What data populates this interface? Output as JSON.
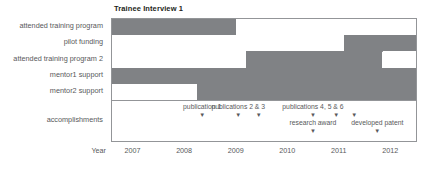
{
  "chart_data": {
    "type": "bar",
    "title": "Trainee Interview 1",
    "xlabel": "Year",
    "ylabel": "",
    "xlim": [
      2006.6,
      2012.5
    ],
    "grid": false,
    "legend": null,
    "tick_labels": [
      "2007",
      "2008",
      "2009",
      "2010",
      "2011",
      "2012"
    ],
    "tick_values": [
      2007,
      2008,
      2009,
      2010,
      2011,
      2012
    ],
    "categories": [
      "attended training program",
      "pilot funding",
      "attended training program 2",
      "mentor1 support",
      "mentor2 support",
      "accomplishments"
    ],
    "series": [
      {
        "name": "attended training program",
        "intervals": [
          {
            "start": 2006.6,
            "end": 2009.0,
            "active": true
          },
          {
            "start": 2009.0,
            "end": 2012.5,
            "active": false
          }
        ]
      },
      {
        "name": "pilot funding",
        "intervals": [
          {
            "start": 2006.6,
            "end": 2011.1,
            "active": false
          },
          {
            "start": 2011.1,
            "end": 2012.5,
            "active": true
          }
        ]
      },
      {
        "name": "attended training program 2",
        "intervals": [
          {
            "start": 2006.6,
            "end": 2009.2,
            "active": false
          },
          {
            "start": 2009.2,
            "end": 2011.85,
            "active": true
          },
          {
            "start": 2011.85,
            "end": 2012.5,
            "active": false
          }
        ]
      },
      {
        "name": "mentor1 support",
        "intervals": [
          {
            "start": 2006.6,
            "end": 2012.5,
            "active": true
          }
        ]
      },
      {
        "name": "mentor2 support",
        "intervals": [
          {
            "start": 2006.6,
            "end": 2008.25,
            "active": false
          },
          {
            "start": 2008.25,
            "end": 2012.5,
            "active": true
          }
        ]
      }
    ],
    "annotations": [
      {
        "label": "publication 1",
        "x": 2008.35,
        "tier": 1
      },
      {
        "label": "publications 2 & 3",
        "x": 2009.05,
        "tier": 1,
        "markers": [
          2009.05,
          2009.45
        ]
      },
      {
        "label": "publications 4, 5 & 6",
        "x": 2010.5,
        "tier": 1,
        "markers": [
          2010.5,
          2010.95,
          2011.3
        ]
      },
      {
        "label": "research award",
        "x": 2010.5,
        "tier": 2
      },
      {
        "label": "developed patent",
        "x": 2011.75,
        "tier": 2
      }
    ]
  },
  "colors": {
    "bar_active": "#808285",
    "bar_inactive": "#ffffff",
    "frame": "#939598",
    "text": "#58595b",
    "title": "#231f20"
  }
}
